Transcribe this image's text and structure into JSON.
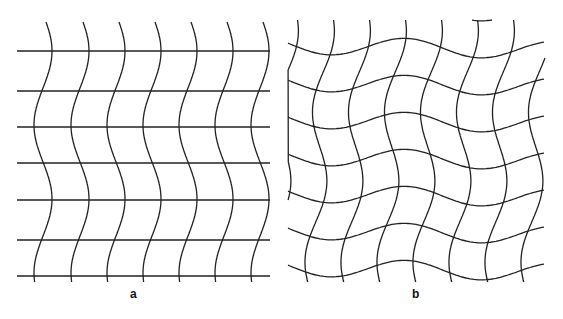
{
  "figure": {
    "panels": [
      {
        "id": "a",
        "label": "a",
        "description": "Straight horizontal lines crossed by sinusoidal vertical lines (in-phase)",
        "horizontal_lines_y": [
          51,
          91,
          127,
          163,
          200,
          240,
          276
        ],
        "vertical_lines_x": [
          45,
          82,
          118,
          154,
          190,
          226,
          262
        ],
        "x_range": [
          17,
          270
        ],
        "y_range": [
          22,
          283
        ]
      },
      {
        "id": "b",
        "label": "b",
        "description": "Both horizontal and vertical lines sinusoidally distorted, forming a wavy mesh",
        "x_range": [
          288,
          545
        ],
        "y_range": [
          20,
          282
        ]
      }
    ],
    "line_color": "#222222"
  }
}
